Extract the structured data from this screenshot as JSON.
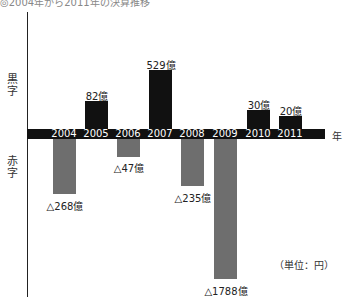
{
  "title": "◎2004年から2011年の決算推移",
  "labels": {
    "profit": "黒字",
    "loss": "赤字",
    "year_axis": "年",
    "unit": "（単位：円）"
  },
  "colors": {
    "profit_bar": "#111111",
    "loss_bar": "#6e6e6e",
    "axis_band": "#111111"
  },
  "chart_data": {
    "type": "bar",
    "title": "◎2004年から2011年の決算推移",
    "xlabel": "年",
    "ylabel": "",
    "unit": "円",
    "categories": [
      "2004",
      "2005",
      "2006",
      "2007",
      "2008",
      "2009",
      "2010",
      "2011"
    ],
    "values_oku": [
      -268,
      82,
      -47,
      529,
      -235,
      -1788,
      30,
      20
    ],
    "data_labels": [
      "△268億",
      "82億",
      "△47億",
      "529億",
      "△235億",
      "△1788億",
      "30億",
      "20億"
    ],
    "legend": [],
    "grid": false
  },
  "bars": [
    {
      "year": "2004",
      "label": "△268億",
      "sign": "neg",
      "x": 53,
      "top": 139,
      "h": 55,
      "label_x": 40,
      "label_y": 198
    },
    {
      "year": "2005",
      "label": "82億",
      "sign": "pos",
      "x": 85,
      "top": 101,
      "h": 28,
      "label_x": 72,
      "label_y": 88
    },
    {
      "year": "2006",
      "label": "△47億",
      "sign": "neg",
      "x": 117,
      "top": 139,
      "h": 18,
      "label_x": 104,
      "label_y": 160
    },
    {
      "year": "2007",
      "label": "529億",
      "sign": "pos",
      "x": 149,
      "top": 70,
      "h": 59,
      "label_x": 136,
      "label_y": 57
    },
    {
      "year": "2008",
      "label": "△235億",
      "sign": "neg",
      "x": 181,
      "top": 139,
      "h": 47,
      "label_x": 168,
      "label_y": 190
    },
    {
      "year": "2009",
      "label": "△1788億",
      "sign": "neg",
      "x": 214,
      "top": 139,
      "h": 140,
      "label_x": 201,
      "label_y": 283
    },
    {
      "year": "2010",
      "label": "30億",
      "sign": "pos",
      "x": 247,
      "top": 110,
      "h": 19,
      "label_x": 234,
      "label_y": 97
    },
    {
      "year": "2011",
      "label": "20億",
      "sign": "pos",
      "x": 279,
      "top": 116,
      "h": 13,
      "label_x": 266,
      "label_y": 103
    }
  ]
}
